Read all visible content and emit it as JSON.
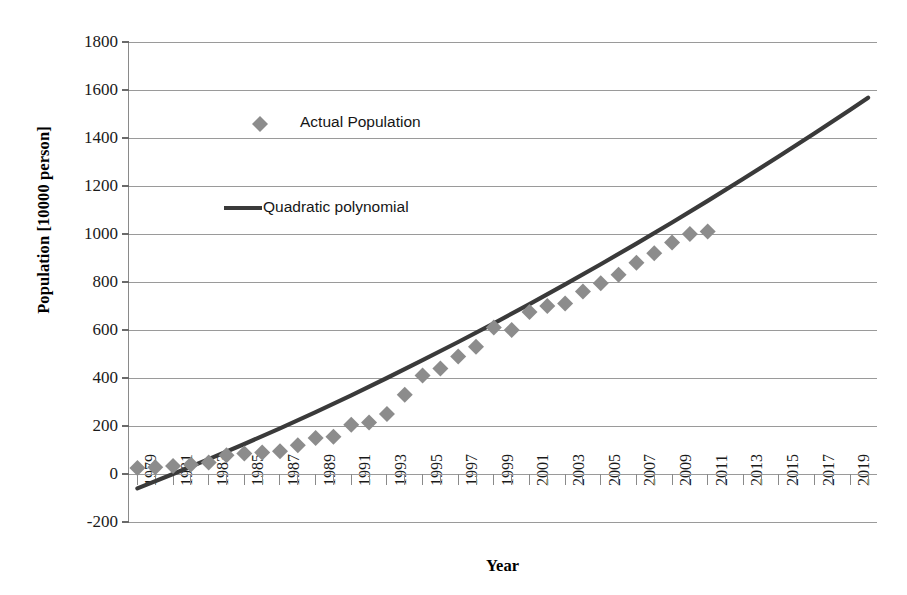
{
  "chart_data": {
    "type": "scatter",
    "title": "",
    "xlabel": "Year",
    "ylabel": "Population [10000 person]",
    "xlim": [
      1978.5,
      2020.5
    ],
    "ylim": [
      -200,
      1800
    ],
    "ytick_step": 200,
    "xtick_step": 1,
    "xtick_label_step": 2,
    "grid": "horizontal",
    "legend_position": "inside-upper-left",
    "yticks": [
      1800,
      1600,
      1400,
      1200,
      1000,
      800,
      600,
      400,
      200,
      0,
      -200
    ],
    "ytick_labels": [
      "1800",
      "1600",
      "1400",
      "1200",
      "1000",
      "800",
      "600",
      "400",
      "200",
      "0",
      "-200"
    ],
    "xticks": [
      1979,
      1980,
      1981,
      1982,
      1983,
      1984,
      1985,
      1986,
      1987,
      1988,
      1989,
      1990,
      1991,
      1992,
      1993,
      1994,
      1995,
      1996,
      1997,
      1998,
      1999,
      2000,
      2001,
      2002,
      2003,
      2004,
      2005,
      2006,
      2007,
      2008,
      2009,
      2010,
      2011,
      2012,
      2013,
      2014,
      2015,
      2016,
      2017,
      2018,
      2019,
      2020
    ],
    "xtick_labels": [
      "1979",
      "1981",
      "1983",
      "1985",
      "1987",
      "1989",
      "1991",
      "1993",
      "1995",
      "1997",
      "1999",
      "2001",
      "2003",
      "2005",
      "2007",
      "2009",
      "2011",
      "2013",
      "2015",
      "2017",
      "2019"
    ],
    "series": [
      {
        "name": "Actual Population",
        "type": "scatter",
        "marker": "diamond",
        "color": "#8c8c8c",
        "x": [
          1979,
          1980,
          1981,
          1982,
          1983,
          1984,
          1985,
          1986,
          1987,
          1988,
          1989,
          1990,
          1991,
          1992,
          1993,
          1994,
          1995,
          1996,
          1997,
          1998,
          1999,
          2000,
          2001,
          2002,
          2003,
          2004,
          2005,
          2006,
          2007,
          2008,
          2009,
          2010,
          2011
        ],
        "values": [
          25,
          28,
          33,
          40,
          48,
          78,
          85,
          90,
          95,
          120,
          150,
          155,
          205,
          215,
          250,
          330,
          410,
          440,
          490,
          530,
          610,
          600,
          675,
          700,
          710,
          760,
          795,
          830,
          880,
          920,
          965,
          1000,
          1010
        ]
      },
      {
        "name": "Quadratic polynomial",
        "type": "line",
        "color": "#3a3a3a",
        "x": [
          1979,
          1981,
          1983,
          1985,
          1987,
          1989,
          1991,
          1993,
          1995,
          1997,
          1999,
          2001,
          2003,
          2005,
          2007,
          2009,
          2011,
          2013,
          2015,
          2017,
          2019,
          2020
        ],
        "values": [
          -60,
          0,
          62,
          125,
          190,
          258,
          328,
          400,
          474,
          550,
          628,
          708,
          790,
          874,
          960,
          1048,
          1138,
          1230,
          1324,
          1420,
          1518,
          1568
        ]
      }
    ],
    "legend": [
      {
        "label": "Actual Population",
        "marker": "diamond",
        "color": "#8c8c8c"
      },
      {
        "label": "Quadratic polynomial",
        "marker": "line",
        "color": "#3a3a3a"
      }
    ]
  }
}
